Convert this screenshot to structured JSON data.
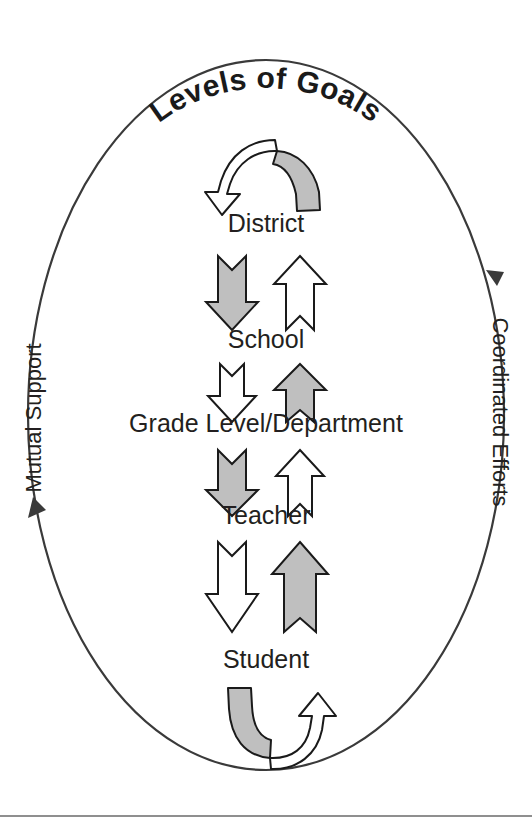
{
  "figure": {
    "title": "Levels of Goals",
    "levels": [
      {
        "id": "district",
        "label": "District",
        "y": 232
      },
      {
        "id": "school",
        "label": "School",
        "y": 348
      },
      {
        "id": "grade",
        "label": "Grade Level/Department",
        "y": 432
      },
      {
        "id": "teacher",
        "label": "Teacher",
        "y": 524
      },
      {
        "id": "student",
        "label": "Student",
        "y": 668
      }
    ],
    "side_labels": {
      "left": "Mutual Support",
      "right": "Coordinated Efforts"
    },
    "arrow_pairs": [
      {
        "between": "District – School",
        "down_fill": "gray",
        "up_fill": "white"
      },
      {
        "between": "School – Grade Level/Department",
        "down_fill": "white",
        "up_fill": "gray"
      },
      {
        "between": "Grade Level/Department – Teacher",
        "down_fill": "gray",
        "up_fill": "white"
      },
      {
        "between": "Teacher – Student",
        "down_fill": "white",
        "up_fill": "gray"
      }
    ],
    "curved_arrows": {
      "top": {
        "name": "district-self-loop",
        "shape": "inverted-u",
        "gray_side": "right",
        "head": "down-left"
      },
      "bottom": {
        "name": "student-self-loop",
        "shape": "u",
        "gray_side": "left",
        "head": "up-right"
      }
    },
    "colors": {
      "gray_fill": "#bfbfbf",
      "outline": "#1a1a1a",
      "oval_stroke": "#3a3a3a",
      "text": "#231f20",
      "background": "#ffffff"
    }
  }
}
